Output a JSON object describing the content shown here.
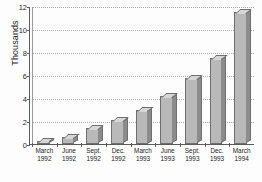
{
  "chart_data": {
    "type": "bar",
    "title": "",
    "xlabel": "",
    "ylabel": "Thousands",
    "ylim": [
      0,
      12
    ],
    "yticks": [
      0,
      2,
      4,
      6,
      8,
      10,
      12
    ],
    "ytick_labels": [
      "0",
      "2",
      "4",
      "6",
      "8",
      "10",
      "12"
    ],
    "grid": true,
    "legend": "none",
    "categories": [
      "March 1992",
      "June 1992",
      "Sept. 1992",
      "Dec. 1992",
      "March 1993",
      "June 1993",
      "Sept. 1993",
      "Dec. 1993",
      "March 1994"
    ],
    "category_lines": [
      {
        "l1": "March",
        "l2": "1992"
      },
      {
        "l1": "June",
        "l2": "1992"
      },
      {
        "l1": "Sept.",
        "l2": "1992"
      },
      {
        "l1": "Dec.",
        "l2": "1992"
      },
      {
        "l1": "March",
        "l2": "1993"
      },
      {
        "l1": "June",
        "l2": "1993"
      },
      {
        "l1": "Sept.",
        "l2": "1993"
      },
      {
        "l1": "Dec.",
        "l2": "1993"
      },
      {
        "l1": "March",
        "l2": "1994"
      }
    ],
    "values": [
      0.3,
      0.6,
      1.4,
      2.1,
      3.0,
      4.2,
      5.7,
      7.5,
      11.5
    ],
    "bar_color": "#b9b9b9",
    "bar_side_color": "#8c8c8c",
    "bar_top_color": "#d6d6d6",
    "bar_edge_color": "#6f6f6f",
    "axis_color": "#5a5a5a",
    "gridline_color": "#a9a9a9",
    "background_color": "#fdfdfd"
  }
}
